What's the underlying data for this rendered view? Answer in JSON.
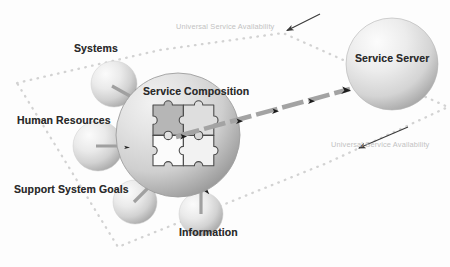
{
  "diagram": {
    "background_color": "#fdfdfd",
    "label_color": "#2b2b2b",
    "annotation_color": "#c2c2c2",
    "boundary_color": "#d4d4d4",
    "arrow_color": "#9a9a9a",
    "sphere_color_light": "#f4f4f4",
    "sphere_color_mid": "#d8d8d8",
    "sphere_color_dark": "#a8a8a8"
  },
  "center": {
    "label": "Service Composition",
    "icon": "puzzle-pieces-icon",
    "x": 178,
    "y": 135,
    "r": 62
  },
  "server": {
    "label": "Service Server",
    "x": 392,
    "y": 64,
    "r": 46
  },
  "inputs": [
    {
      "label": "Systems",
      "label_x": 74,
      "label_y": 48,
      "cx": 114,
      "cy": 84,
      "r": 23
    },
    {
      "label": "Human Resources",
      "label_x": 17,
      "label_y": 120,
      "cx": 98,
      "cy": 146,
      "r": 25
    },
    {
      "label": "Support System Goals",
      "label_x": 14,
      "label_y": 189,
      "cx": 135,
      "cy": 202,
      "r": 22
    },
    {
      "label": "Information",
      "label_x": 179,
      "label_y": 232,
      "cx": 201,
      "cy": 214,
      "r": 22
    }
  ],
  "annotations": [
    {
      "text": "Universal Service Availability",
      "x": 176,
      "y": 27,
      "arrow_from_x": 318,
      "arrow_from_y": 15,
      "arrow_to_x": 286,
      "arrow_to_y": 31
    },
    {
      "text": "Universal Service Availability",
      "x": 331,
      "y": 145,
      "arrow_from_x": 405,
      "arrow_from_y": 128,
      "arrow_to_x": 357,
      "arrow_to_y": 149
    }
  ],
  "flow": {
    "label": "service-flow-arrow",
    "from_x": 230,
    "from_y": 118,
    "to_x": 352,
    "to_y": 89,
    "style": "thick-dashed"
  },
  "boundary": {
    "name": "universal-service-availability-boundary",
    "style": "dotted-polygon",
    "points": "17,83 160,50 283,33 448,107 327,163 118,247"
  }
}
